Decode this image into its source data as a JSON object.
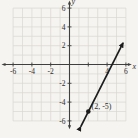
{
  "figure": {
    "background_color": "#f5f4f1",
    "grid_color": "#dad7d0",
    "axis_color": "#3f3f3f",
    "line_color": "#1c1c1c",
    "text_color": "#2e2e2e"
  },
  "chart_data": {
    "type": "line",
    "title": "",
    "xlabel": "x",
    "ylabel": "y",
    "xlim": [
      -6,
      6
    ],
    "ylim": [
      -6,
      6
    ],
    "grid_step": 1,
    "tick_step": 2,
    "grid_on": true,
    "x_tick_labels": [
      "-6",
      "-4",
      "-2",
      "4",
      "6"
    ],
    "x_tick_values": [
      -6,
      -4,
      -2,
      4,
      6
    ],
    "y_tick_labels": [
      "6",
      "4",
      "2",
      "-2",
      "-4",
      "-6"
    ],
    "y_tick_values": [
      6,
      4,
      2,
      -2,
      -4,
      -6
    ],
    "series": [
      {
        "name": "line-through-point",
        "slope": 2,
        "through_point": [
          2,
          -5
        ],
        "segment": [
          [
            1.2,
            -6.6
          ],
          [
            5.7,
            2.3
          ]
        ],
        "arrows_both_ends": true
      }
    ],
    "point": {
      "x": 2,
      "y": -5,
      "label": "(2, -5)"
    }
  }
}
